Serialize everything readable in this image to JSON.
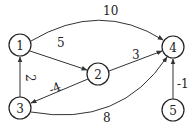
{
  "graph": {
    "type": "directed-weighted",
    "nodes": [
      {
        "id": "1",
        "label": "1",
        "x": 20,
        "y": 45
      },
      {
        "id": "2",
        "label": "2",
        "x": 98,
        "y": 74
      },
      {
        "id": "3",
        "label": "3",
        "x": 20,
        "y": 108
      },
      {
        "id": "4",
        "label": "4",
        "x": 173,
        "y": 47
      },
      {
        "id": "5",
        "label": "5",
        "x": 173,
        "y": 110
      }
    ],
    "edges": [
      {
        "from": "1",
        "to": "4",
        "weight": "10"
      },
      {
        "from": "1",
        "to": "2",
        "weight": "5"
      },
      {
        "from": "2",
        "to": "4",
        "weight": "3"
      },
      {
        "from": "2",
        "to": "3",
        "weight": "-4"
      },
      {
        "from": "3",
        "to": "1",
        "weight": "2"
      },
      {
        "from": "3",
        "to": "4",
        "weight": "8"
      },
      {
        "from": "5",
        "to": "4",
        "weight": "-1"
      }
    ]
  },
  "style": {
    "stroke": "#333333",
    "node_fill": "#ffffff",
    "text": "#222222"
  }
}
